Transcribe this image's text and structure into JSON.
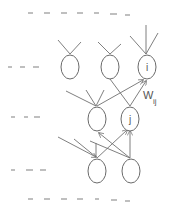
{
  "diagram": {
    "type": "layered-neural-network",
    "node_labels": {
      "i": "i",
      "j": "j"
    },
    "weight_label": {
      "main": "W",
      "subscript": "ij"
    },
    "layers": [
      {
        "name": "upper-layer",
        "nodes": [
          "",
          "",
          "i"
        ]
      },
      {
        "name": "middle-layer",
        "nodes": [
          "",
          "j"
        ]
      },
      {
        "name": "lower-layer",
        "nodes": [
          "",
          ""
        ]
      }
    ],
    "ellipsis_markers": {
      "top": "- - - - - _ _",
      "bottom": "- - - - - _ _",
      "left": [
        "- - -",
        "- - -",
        "- - -"
      ]
    },
    "colors": {
      "stroke": "#707070",
      "background": "#ffffff"
    }
  }
}
